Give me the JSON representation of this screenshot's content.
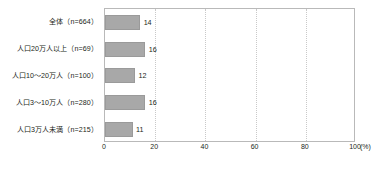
{
  "chart_data": {
    "type": "bar",
    "orientation": "horizontal",
    "title": "",
    "xlabel": "(%)",
    "ylabel": "",
    "categories": [
      "全体（n=664）",
      "人口20万人以上（n=69）",
      "人口10〜20万人（n=100）",
      "人口3〜10万人（n=280）",
      "人口3万人未満（n=215）"
    ],
    "values": [
      14,
      16,
      12,
      16,
      11
    ],
    "value_labels": [
      "14",
      "16",
      "12",
      "16",
      "11"
    ],
    "xlim": [
      0,
      100
    ],
    "xticks": [
      0,
      20,
      40,
      60,
      80,
      100
    ],
    "xtick_labels": [
      "0",
      "20",
      "40",
      "60",
      "80",
      "100"
    ],
    "unit_label": "(%)",
    "grid": true,
    "grid_axis": "x",
    "legend": null,
    "bar_color": "#a8a8a8",
    "bar_border_color": "#9a9a9a",
    "grid_color": "#c9c9c9",
    "frame_color": "#b9b9b9",
    "text_color": "#231f20"
  }
}
